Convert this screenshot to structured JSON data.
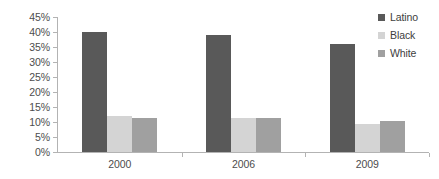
{
  "chart_data": {
    "type": "bar",
    "title": "",
    "subtitle": "",
    "xlabel": "",
    "ylabel": "",
    "categories": [
      "2000",
      "2006",
      "2009"
    ],
    "series": [
      {
        "name": "Latino",
        "color": "#595959",
        "values": [
          40,
          39,
          36
        ]
      },
      {
        "name": "Black",
        "color": "#d4d4d4",
        "values": [
          12,
          11.5,
          9.5
        ]
      },
      {
        "name": "White",
        "color": "#a0a0a0",
        "values": [
          11.5,
          11.5,
          10.5
        ]
      }
    ],
    "ylim": [
      0,
      45
    ],
    "ytick_values": [
      0,
      5,
      10,
      15,
      20,
      25,
      30,
      35,
      40,
      45
    ],
    "ytick_labels": [
      "0%",
      "5%",
      "10%",
      "15%",
      "20%",
      "25%",
      "30%",
      "35%",
      "40%",
      "45%"
    ],
    "grid": false,
    "legend_position": "top-right",
    "bar_mode": "grouped",
    "axis_color": "#b3b3b3",
    "text_color": "#4d4d4d",
    "background": "#ffffff"
  }
}
